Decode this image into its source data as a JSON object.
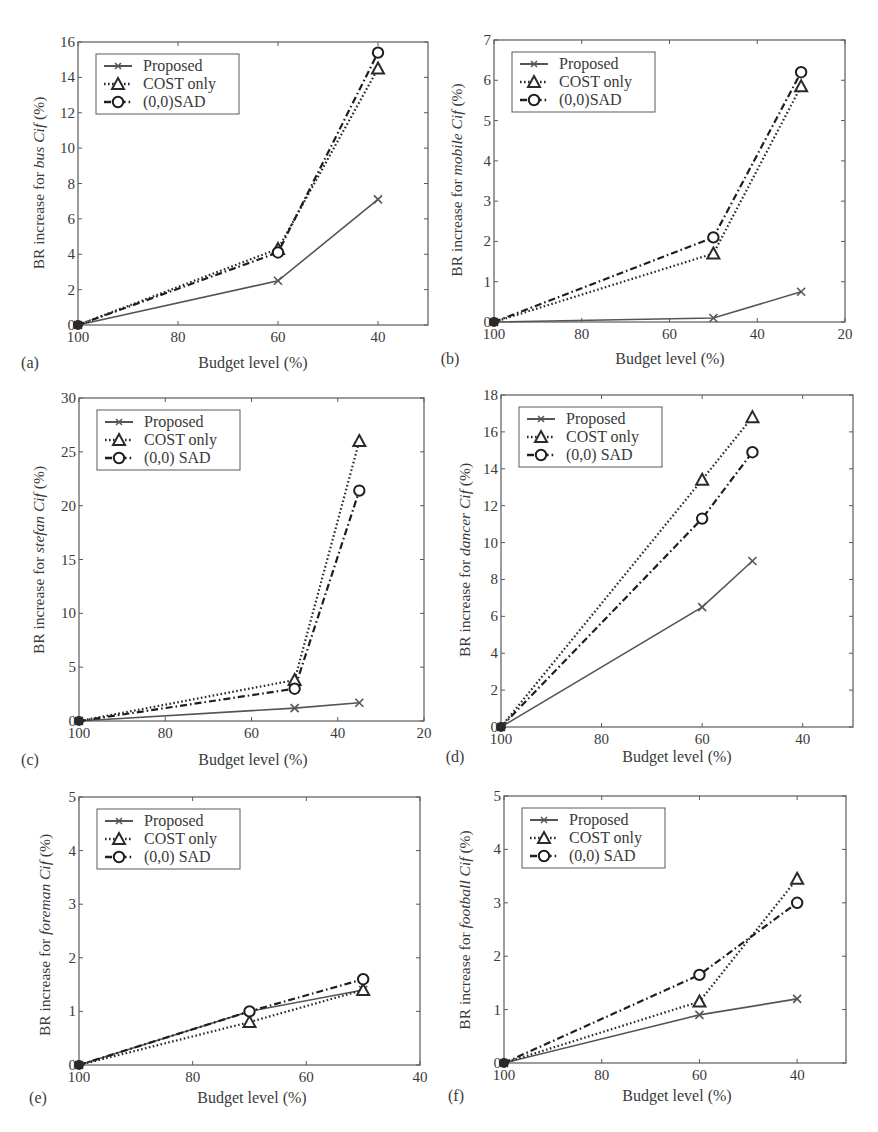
{
  "figure": {
    "legend_labels": [
      "Proposed",
      "COST only",
      "(0,0)SAD"
    ]
  },
  "chart_data": [
    {
      "panel": "(a)",
      "type": "line",
      "ylabel_prefix": "BR increase for ",
      "ylabel_italic": "bus Cif",
      "ylabel_suffix": " (%)",
      "xlabel": "Budget level (%)",
      "xlim": [
        100,
        30
      ],
      "ylim": [
        0,
        16
      ],
      "xticks": [
        100,
        80,
        60,
        40
      ],
      "yticks": [
        0,
        2,
        4,
        6,
        8,
        10,
        12,
        14,
        16
      ],
      "grid": false,
      "legend_position": "upper left",
      "x": [
        100,
        60,
        40
      ],
      "series": [
        {
          "name": "Proposed",
          "style": "solid",
          "marker": "x",
          "values": [
            0,
            2.5,
            7.1
          ]
        },
        {
          "name": "COST only",
          "style": "dotted",
          "marker": "triangle",
          "values": [
            0,
            4.3,
            14.5
          ]
        },
        {
          "name": "(0,0)SAD",
          "style": "dashdot",
          "marker": "circle",
          "values": [
            0,
            4.1,
            15.4
          ]
        }
      ],
      "frame": {
        "x": 78,
        "y": 42,
        "w": 350,
        "h": 283
      },
      "panel_label_pos": [
        30,
        368
      ],
      "xlabel_pos": [
        253,
        368
      ],
      "ylabel_pos": [
        44,
        183
      ]
    },
    {
      "panel": "(b)",
      "type": "line",
      "ylabel_prefix": "BR increase for ",
      "ylabel_italic": "mobile Cif",
      "ylabel_suffix": " (%)",
      "xlabel": "Budget level (%)",
      "xlim": [
        100,
        20
      ],
      "ylim": [
        0,
        7
      ],
      "xticks": [
        100,
        80,
        60,
        40,
        20
      ],
      "yticks": [
        0,
        1,
        2,
        3,
        4,
        5,
        6,
        7
      ],
      "grid": false,
      "legend_position": "upper left",
      "x": [
        100,
        50,
        30
      ],
      "series": [
        {
          "name": "Proposed",
          "style": "solid",
          "marker": "x",
          "values": [
            0,
            0.1,
            0.75
          ]
        },
        {
          "name": "COST only",
          "style": "dotted",
          "marker": "triangle",
          "values": [
            0,
            1.7,
            5.85
          ]
        },
        {
          "name": "(0,0)SAD",
          "style": "dashdot",
          "marker": "circle",
          "values": [
            0,
            2.1,
            6.2
          ]
        }
      ],
      "frame": {
        "x": 494,
        "y": 40,
        "w": 351,
        "h": 282
      },
      "panel_label_pos": [
        450,
        364
      ],
      "xlabel_pos": [
        670,
        364
      ],
      "ylabel_pos": [
        462,
        180
      ]
    },
    {
      "panel": "(c)",
      "type": "line",
      "ylabel_prefix": "BR increase for ",
      "ylabel_italic": "stefan Cif",
      "ylabel_suffix": " (%)",
      "xlabel": "Budget level (%)",
      "xlim": [
        100,
        20
      ],
      "ylim": [
        0,
        30
      ],
      "xticks": [
        100,
        80,
        60,
        40,
        20
      ],
      "yticks": [
        0,
        5,
        10,
        15,
        20,
        25,
        30
      ],
      "grid": false,
      "legend_position": "upper left",
      "x": [
        100,
        50,
        35
      ],
      "series": [
        {
          "name": "Proposed",
          "style": "solid",
          "marker": "x",
          "values": [
            0,
            1.2,
            1.7
          ]
        },
        {
          "name": "COST only",
          "style": "dotted",
          "marker": "triangle",
          "values": [
            0,
            3.8,
            26
          ]
        },
        {
          "name": "(0,0) SAD",
          "style": "dashdot",
          "marker": "circle",
          "values": [
            0,
            3.0,
            21.4
          ]
        }
      ],
      "frame": {
        "x": 79,
        "y": 398,
        "w": 345,
        "h": 323
      },
      "panel_label_pos": [
        30,
        765
      ],
      "xlabel_pos": [
        253,
        765
      ],
      "ylabel_pos": [
        44,
        560
      ]
    },
    {
      "panel": "(d)",
      "type": "line",
      "ylabel_prefix": "BR increase for ",
      "ylabel_italic": "dancer Cif",
      "ylabel_suffix": " (%)",
      "xlabel": "Budget level (%)",
      "xlim": [
        100,
        30
      ],
      "ylim": [
        0,
        18
      ],
      "xticks": [
        100,
        80,
        60,
        40
      ],
      "yticks": [
        0,
        2,
        4,
        6,
        8,
        10,
        12,
        14,
        16,
        18
      ],
      "grid": false,
      "legend_position": "upper left",
      "x": [
        100,
        60,
        50
      ],
      "series": [
        {
          "name": "Proposed",
          "style": "solid",
          "marker": "x",
          "values": [
            0,
            6.5,
            9.0
          ]
        },
        {
          "name": "COST only",
          "style": "dotted",
          "marker": "triangle",
          "values": [
            0,
            13.4,
            16.8
          ]
        },
        {
          "name": "(0,0) SAD",
          "style": "dashdot",
          "marker": "circle",
          "values": [
            0,
            11.3,
            14.9
          ]
        }
      ],
      "frame": {
        "x": 501,
        "y": 395,
        "w": 352,
        "h": 332
      },
      "panel_label_pos": [
        455,
        762
      ],
      "xlabel_pos": [
        677,
        762
      ],
      "ylabel_pos": [
        470,
        560
      ]
    },
    {
      "panel": "(e)",
      "type": "line",
      "ylabel_prefix": "BR increase for ",
      "ylabel_italic": "foreman Cif",
      "ylabel_suffix": " (%)",
      "xlabel": "Budget level (%)",
      "xlim": [
        100,
        40
      ],
      "ylim": [
        0,
        5
      ],
      "xticks": [
        100,
        80,
        60,
        40
      ],
      "yticks": [
        0,
        1,
        2,
        3,
        4,
        5
      ],
      "grid": false,
      "legend_position": "upper left",
      "x": [
        100,
        70,
        50
      ],
      "series": [
        {
          "name": "Proposed",
          "style": "solid",
          "marker": "x",
          "values": [
            0,
            1.0,
            1.4
          ]
        },
        {
          "name": "COST only",
          "style": "dotted",
          "marker": "triangle",
          "values": [
            0,
            0.8,
            1.4
          ]
        },
        {
          "name": "(0,0) SAD",
          "style": "dashdot",
          "marker": "circle",
          "values": [
            0,
            1.0,
            1.6
          ]
        }
      ],
      "frame": {
        "x": 79,
        "y": 797,
        "w": 341,
        "h": 268
      },
      "panel_label_pos": [
        38,
        1103
      ],
      "xlabel_pos": [
        252,
        1103
      ],
      "ylabel_pos": [
        50,
        935
      ]
    },
    {
      "panel": "(f)",
      "type": "line",
      "ylabel_prefix": "BR increase for ",
      "ylabel_italic": "football Cif",
      "ylabel_suffix": " (%)",
      "xlabel": "Budget level (%)",
      "xlim": [
        100,
        30
      ],
      "ylim": [
        0,
        5
      ],
      "xticks": [
        100,
        80,
        60,
        40
      ],
      "yticks": [
        0,
        1,
        2,
        3,
        4,
        5
      ],
      "grid": false,
      "legend_position": "upper left",
      "x": [
        100,
        60,
        40
      ],
      "series": [
        {
          "name": "Proposed",
          "style": "solid",
          "marker": "x",
          "values": [
            0,
            0.9,
            1.2
          ]
        },
        {
          "name": "COST only",
          "style": "dotted",
          "marker": "triangle",
          "values": [
            0,
            1.15,
            3.45
          ]
        },
        {
          "name": "(0,0) SAD",
          "style": "dashdot",
          "marker": "circle",
          "values": [
            0,
            1.65,
            3.0
          ]
        }
      ],
      "frame": {
        "x": 504,
        "y": 796,
        "w": 342,
        "h": 267
      },
      "panel_label_pos": [
        456,
        1101
      ],
      "xlabel_pos": [
        677,
        1101
      ],
      "ylabel_pos": [
        470,
        930
      ]
    }
  ],
  "colors": {
    "axis": "#5a5a5a",
    "text": "#3a3a3a",
    "proposed": "#555555",
    "cost": "#2a2a2a",
    "sad": "#1e1e1e",
    "background": "#ffffff"
  }
}
